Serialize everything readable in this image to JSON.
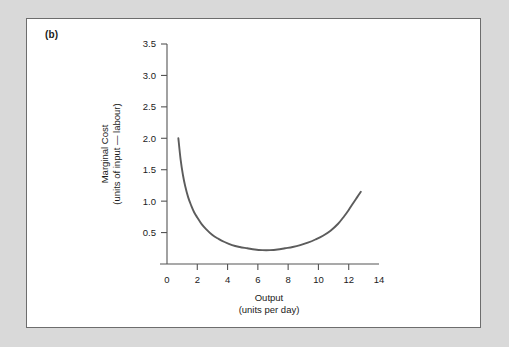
{
  "figure": {
    "panel_label": "(b)",
    "background_color": "#d9d9d9",
    "panel_color": "#ffffff",
    "panel_border_color": "#6d6d6d",
    "curve_color": "#5c5c5c",
    "axis_color": "#555555",
    "text_color": "#1a1a1a"
  },
  "chart_data": {
    "type": "line",
    "title": "",
    "subtitle": "",
    "xlabel": "Output",
    "xlabel_sub": "(units per day)",
    "ylabel": "Marginal Cost",
    "ylabel_sub": "(units of input — labour)",
    "xlim": [
      0,
      14
    ],
    "ylim": [
      0,
      3.5
    ],
    "xticks": [
      0,
      2,
      4,
      6,
      8,
      10,
      12,
      14
    ],
    "xtick_labels": [
      "0",
      "2",
      "4",
      "6",
      "8",
      "10",
      "12",
      "14"
    ],
    "yticks": [
      0.5,
      1.0,
      1.5,
      2.0,
      2.5,
      3.0,
      3.5
    ],
    "ytick_labels": [
      "0.5",
      "1.0",
      "1.5",
      "2.0",
      "2.5",
      "3.0",
      "3.5"
    ],
    "grid": false,
    "legend": false,
    "legend_position": "none",
    "annotations": [
      "(b)"
    ],
    "series": [
      {
        "name": "Marginal Cost",
        "color": "#5c5c5c",
        "x": [
          0.75,
          0.9,
          1.05,
          1.2,
          1.4,
          1.6,
          1.8,
          2.0,
          2.3,
          2.6,
          3.0,
          3.4,
          3.8,
          4.3,
          4.8,
          5.3,
          5.8,
          6.3,
          6.8,
          7.3,
          7.8,
          8.3,
          8.8,
          9.3,
          9.8,
          10.3,
          10.8,
          11.3,
          11.7,
          12.0,
          12.3,
          12.55,
          12.8
        ],
        "y": [
          2.0,
          1.66,
          1.42,
          1.24,
          1.06,
          0.93,
          0.82,
          0.74,
          0.63,
          0.55,
          0.46,
          0.4,
          0.35,
          0.3,
          0.27,
          0.25,
          0.23,
          0.22,
          0.22,
          0.23,
          0.25,
          0.27,
          0.3,
          0.34,
          0.39,
          0.45,
          0.53,
          0.64,
          0.76,
          0.86,
          0.97,
          1.06,
          1.15
        ]
      }
    ]
  }
}
